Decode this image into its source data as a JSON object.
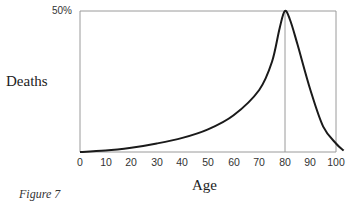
{
  "chart_data": {
    "type": "line",
    "title": "",
    "caption": "Figure 7",
    "xlabel": "Age",
    "ylabel": "Deaths",
    "xlim": [
      0,
      100
    ],
    "ylim": [
      0,
      50
    ],
    "x_ticks": [
      "0",
      "10",
      "20",
      "30",
      "40",
      "50",
      "60",
      "70",
      "80",
      "90",
      "100"
    ],
    "y_ticks": [
      "50%"
    ],
    "grid": false,
    "reference_lines": [
      {
        "axis": "x",
        "value": 80
      }
    ],
    "legend": null,
    "series": [
      {
        "name": "Deaths",
        "x": [
          0,
          10,
          20,
          30,
          40,
          50,
          60,
          70,
          75,
          78,
          80,
          82,
          85,
          90,
          95,
          100,
          103
        ],
        "values": [
          0,
          0.5,
          1.5,
          3,
          5,
          8,
          13,
          22,
          32,
          44,
          50,
          47,
          38,
          22,
          9,
          3,
          0.5
        ]
      }
    ],
    "colors": {
      "line": "#1a1a1a",
      "axis": "#9a9a9a"
    }
  }
}
